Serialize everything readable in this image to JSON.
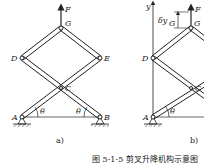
{
  "figure": {
    "panel_a": {
      "label": "a)",
      "points": {
        "G": "G",
        "D": "D",
        "E": "E",
        "C": "C",
        "A": "A",
        "B": "B"
      },
      "force": "F",
      "angle_left": "θ",
      "angle_right": "θ"
    },
    "panel_b": {
      "label": "b)",
      "axis": "y",
      "points": {
        "G": "G",
        "D": "D",
        "C": "C",
        "A": "A"
      },
      "force": "F",
      "virtual_disp": "δy",
      "virtual_disp_sub": "G",
      "angle": "θ"
    },
    "caption": "图 5-1-5  剪叉升降机构示意图"
  }
}
